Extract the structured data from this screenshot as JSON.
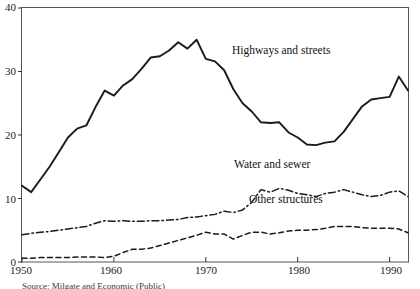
{
  "chart_data": {
    "type": "line",
    "title": "",
    "xlabel": "",
    "ylabel": "",
    "xlim": [
      1950,
      1992
    ],
    "ylim": [
      0,
      40
    ],
    "xticks": [
      1950,
      1960,
      1970,
      1980,
      1990
    ],
    "yticks": [
      0,
      10,
      20,
      30,
      40
    ],
    "xticklabels": [
      "1950",
      "1960",
      "1970",
      "1980",
      "1990"
    ],
    "yticklabels": [
      "0",
      "10",
      "20",
      "30",
      "40"
    ],
    "grid": false,
    "legend_position": "inline-annotations",
    "frame": "box",
    "x": [
      1950,
      1951,
      1952,
      1953,
      1954,
      1955,
      1956,
      1957,
      1958,
      1959,
      1960,
      1961,
      1962,
      1963,
      1964,
      1965,
      1966,
      1967,
      1968,
      1969,
      1970,
      1971,
      1972,
      1973,
      1974,
      1975,
      1976,
      1977,
      1978,
      1979,
      1980,
      1981,
      1982,
      1983,
      1984,
      1985,
      1986,
      1987,
      1988,
      1989,
      1990,
      1991,
      1992
    ],
    "series": [
      {
        "name": "Highways and streets",
        "style": "solid",
        "color": "#1a1a1a",
        "values": [
          12.0,
          11.0,
          13.0,
          15.0,
          17.3,
          19.6,
          21.0,
          21.5,
          24.4,
          27.0,
          26.2,
          27.8,
          28.8,
          30.4,
          32.2,
          32.4,
          33.3,
          34.6,
          33.6,
          35.0,
          32.0,
          31.6,
          30.2,
          27.2,
          25.0,
          23.7,
          22.0,
          21.9,
          22.0,
          20.4,
          19.6,
          18.5,
          18.4,
          18.8,
          19.0,
          20.5,
          22.5,
          24.5,
          25.6,
          25.8,
          26.0,
          29.2,
          27.0
        ]
      },
      {
        "name": "Water and sewer",
        "style": "dash-dot",
        "color": "#1a1a1a",
        "values": [
          4.3,
          4.5,
          4.7,
          4.8,
          5.0,
          5.2,
          5.4,
          5.6,
          6.1,
          6.5,
          6.4,
          6.5,
          6.4,
          6.4,
          6.5,
          6.5,
          6.6,
          6.7,
          7.0,
          7.1,
          7.3,
          7.5,
          8.0,
          7.8,
          8.2,
          9.4,
          11.4,
          11.0,
          11.6,
          11.3,
          10.8,
          10.6,
          10.3,
          10.8,
          11.0,
          11.4,
          11.0,
          10.6,
          10.3,
          10.5,
          11.0,
          11.2,
          10.3
        ]
      },
      {
        "name": "Other structures",
        "style": "dashed",
        "color": "#1a1a1a",
        "values": [
          0.6,
          0.6,
          0.7,
          0.7,
          0.7,
          0.7,
          0.8,
          0.8,
          0.8,
          0.7,
          0.9,
          1.5,
          2.0,
          2.0,
          2.2,
          2.6,
          3.0,
          3.4,
          3.8,
          4.2,
          4.7,
          4.4,
          4.4,
          3.6,
          4.2,
          4.7,
          4.7,
          4.4,
          4.6,
          4.9,
          5.0,
          5.0,
          5.1,
          5.3,
          5.6,
          5.6,
          5.6,
          5.4,
          5.3,
          5.3,
          5.3,
          5.2,
          4.6
        ]
      }
    ],
    "annotations": [
      {
        "text": "Highways and streets",
        "x_px": 232,
        "y_px": 44
      },
      {
        "text": "Water and sewer",
        "x_px": 234,
        "y_px": 158
      },
      {
        "text": "Other structures",
        "x_px": 249,
        "y_px": 193
      }
    ]
  },
  "axis": {
    "y_ticks": [
      {
        "label": "40",
        "top": 2
      },
      {
        "label": "30",
        "top": 66
      },
      {
        "label": "20",
        "top": 130
      },
      {
        "label": "10",
        "top": 194
      },
      {
        "label": "0",
        "top": 257
      }
    ],
    "x_ticks": [
      {
        "label": "1950",
        "left": 10
      },
      {
        "label": "1960",
        "left": 100
      },
      {
        "label": "1970",
        "left": 195
      },
      {
        "label": "1980",
        "left": 288
      },
      {
        "label": "1990",
        "left": 380
      }
    ]
  },
  "source_note": {
    "text": "Source: Milgate and Economic (Public)"
  }
}
